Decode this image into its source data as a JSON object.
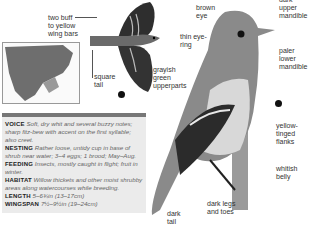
{
  "labels": {
    "wing_bars": "two buff to yellow wing bars",
    "square_tail": "square tail",
    "grayish_green": "grayish green upperparts",
    "brown_eye": "brown eye",
    "thin_eye_ring": "thin eye-ring",
    "upper_mandible": "dark upper mandible",
    "lower_mandible": "paler lower mandible",
    "yellow_flanks": "yellow-tinged flanks",
    "whitish_belly": "whitish belly",
    "dark_legs": "dark legs and toes",
    "dark_tail": "dark tail"
  },
  "info": {
    "voice": {
      "head": "VOICE",
      "text": "Soft, dry whit and several buzzy notes; sharp fitz-bew with accent on the first syllable; also creet."
    },
    "nesting": {
      "head": "NESTING",
      "text": "Rather loose, untidy cup in base of shrub near water; 3–4 eggs; 1 brood; May–Aug."
    },
    "feeding": {
      "head": "FEEDING",
      "text": "Insects, mostly caught in flight; fruit in winter."
    },
    "habitat": {
      "head": "HABITAT",
      "text": "Willow thickets and other moist shrubby areas along watercourses while breeding."
    },
    "length": {
      "head": "LENGTH",
      "text": "5–6¾in (13–17cm)"
    },
    "wingspan": {
      "head": "WINGSPAN",
      "text": "7½–9½in (19–24cm)"
    }
  },
  "colors": {
    "info_bg": "#ebebeb",
    "bar": "#777777"
  }
}
